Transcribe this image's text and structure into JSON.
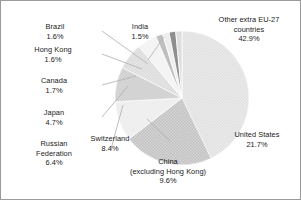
{
  "chart_data": {
    "type": "pie",
    "title": "",
    "subtitle": "",
    "xlabel": "",
    "ylabel": "",
    "legend_position": "none",
    "grid": false,
    "units": "percent",
    "start_angle_deg": 0,
    "direction": "clockwise",
    "categories": [
      "Other extra EU-27 countries",
      "United States",
      "China (excluding Hong Kong)",
      "Switzerland",
      "Russian Federation",
      "Japan",
      "Canada",
      "Hong Kong",
      "Brazil",
      "India"
    ],
    "values": [
      42.9,
      21.7,
      9.6,
      8.4,
      6.4,
      4.7,
      1.7,
      1.6,
      1.6,
      1.5
    ],
    "slices": [
      {
        "name": "other-extra-eu27",
        "label_line1": "Other extra EU-27",
        "label_line2": "countries",
        "value_label": "42.9%",
        "value": 42.9,
        "color": "#d9d9d9",
        "texture": "fine-dot"
      },
      {
        "name": "united-states",
        "label_line1": "United States",
        "label_line2": "",
        "value_label": "21.7%",
        "value": 21.7,
        "color": "#9c9c9c",
        "texture": "checker"
      },
      {
        "name": "china-excluding-hong-kong",
        "label_line1": "China",
        "label_line2": "(excluding Hong Kong)",
        "value_label": "9.6%",
        "value": 9.6,
        "color": "#efefef",
        "texture": "plain"
      },
      {
        "name": "switzerland",
        "label_line1": "Switzerland",
        "label_line2": "",
        "value_label": "8.4%",
        "value": 8.4,
        "color": "#b4b4b4",
        "texture": "fine-dot"
      },
      {
        "name": "russian-federation",
        "label_line1": "Russian",
        "label_line2": "Federation",
        "value_label": "6.4%",
        "value": 6.4,
        "color": "#cfcfcf",
        "texture": "fine-dot"
      },
      {
        "name": "japan",
        "label_line1": "Japan",
        "label_line2": "",
        "value_label": "4.7%",
        "value": 4.7,
        "color": "#f4f4f4",
        "texture": "plain"
      },
      {
        "name": "canada",
        "label_line1": "Canada",
        "label_line2": "",
        "value_label": "1.7%",
        "value": 1.7,
        "color": "#bfbfbf",
        "texture": "plain"
      },
      {
        "name": "hong-kong",
        "label_line1": "Hong Kong",
        "label_line2": "",
        "value_label": "1.6%",
        "value": 1.6,
        "color": "#ededed",
        "texture": "plain"
      },
      {
        "name": "brazil",
        "label_line1": "Brazil",
        "label_line2": "",
        "value_label": "1.6%",
        "value": 1.6,
        "color": "#8e8e8e",
        "texture": "plain"
      },
      {
        "name": "india",
        "label_line1": "India",
        "label_line2": "",
        "value_label": "1.5%",
        "value": 1.5,
        "color": "#dedede",
        "texture": "plain"
      }
    ]
  },
  "style": {
    "background": "#ffffff",
    "border_color": "#9a9a9a",
    "text_color": "#1a1a1a",
    "leader_color": "#b0b0b0",
    "slice_edge_color": "#ffffff"
  }
}
